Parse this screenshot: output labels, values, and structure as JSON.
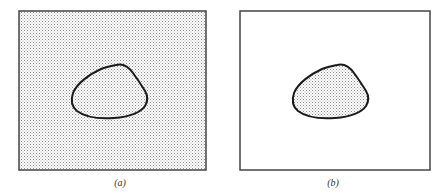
{
  "figure": {
    "panels": [
      {
        "id": "a",
        "caption": "(a)",
        "background_fill": "stippled",
        "region_fill": "stippled",
        "description": "Entire rectangle is shaded; closed curve outlined"
      },
      {
        "id": "b",
        "caption": "(b)",
        "background_fill": "white",
        "region_fill": "stippled",
        "description": "Only the interior of the closed curve is shaded"
      }
    ],
    "colors": {
      "stroke": "#1a1a1a",
      "border": "#444444",
      "stipple_fg": "#9a9a9a",
      "stipple_bg": "#ffffff"
    }
  }
}
